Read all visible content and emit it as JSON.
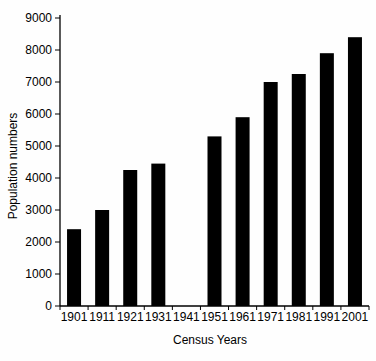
{
  "chart_data": {
    "type": "bar",
    "title": "",
    "xlabel": "Census Years",
    "ylabel": "Population numbers",
    "categories": [
      "1901",
      "1911",
      "1921",
      "1931",
      "1941",
      "1951",
      "1961",
      "1971",
      "1981",
      "1991",
      "2001"
    ],
    "values": [
      2400,
      3000,
      4250,
      4450,
      0,
      5300,
      5900,
      7000,
      7250,
      7900,
      8400
    ],
    "ylim": [
      0,
      9000
    ],
    "yticks": [
      0,
      1000,
      2000,
      3000,
      4000,
      5000,
      6000,
      7000,
      8000,
      9000
    ],
    "grid": false,
    "legend": null,
    "bar_color": "#000000",
    "axis_color": "#000000",
    "text_color": "#000000",
    "background_color": "#fefefe"
  }
}
